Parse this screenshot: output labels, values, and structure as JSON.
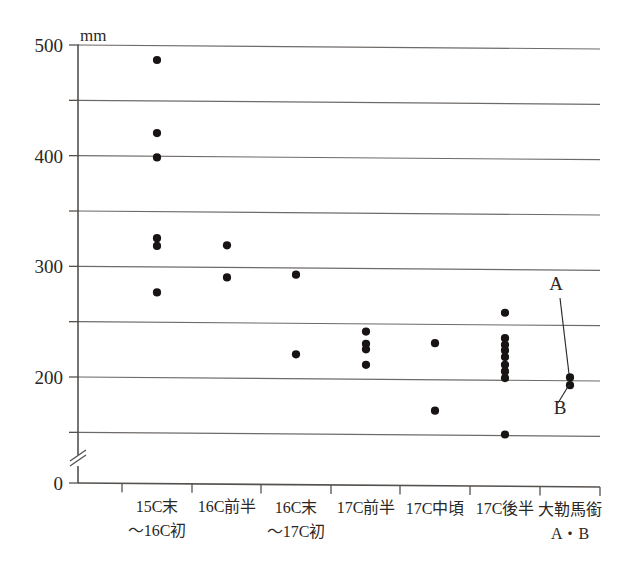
{
  "chart_data": {
    "type": "scatter",
    "title": "",
    "subtitle": "",
    "xlabel": "",
    "ylabel": "",
    "unit_label": "mm",
    "ylim": [
      0,
      500
    ],
    "axis_break": true,
    "axis_break_note": "y-axis broken between 0 and approx 100",
    "grid": true,
    "grid_values": [
      500,
      450,
      400,
      350,
      300,
      250,
      200,
      150
    ],
    "ytick_labels": [
      "500",
      "400",
      "300",
      "200",
      "0"
    ],
    "ytick_values": [
      500,
      400,
      300,
      200,
      0
    ],
    "legend_position": "none",
    "categories": [
      "15C末\n～16C初",
      "16C前半",
      "16C末\n～17C初",
      "17C前半",
      "17C中頃",
      "17C後半",
      "大勒馬銜\nA・B"
    ],
    "category_labels": [
      {
        "line1": "15C末",
        "line2": "～16C初"
      },
      {
        "line1": "16C前半",
        "line2": ""
      },
      {
        "line1": "16C末",
        "line2": "～17C初"
      },
      {
        "line1": "17C前半",
        "line2": ""
      },
      {
        "line1": "17C中頃",
        "line2": ""
      },
      {
        "line1": "17C後半",
        "line2": ""
      },
      {
        "line1": "大勒馬銜",
        "line2": "A・B"
      }
    ],
    "series": [
      {
        "name": "馬銜寸法",
        "points": [
          {
            "category": 0,
            "values": [
              487,
              421,
              399,
              326,
              319,
              277
            ]
          },
          {
            "category": 1,
            "values": [
              320,
              291
            ]
          },
          {
            "category": 2,
            "values": [
              294,
              222
            ]
          },
          {
            "category": 3,
            "values": [
              243,
              232,
              227,
              213
            ]
          },
          {
            "category": 4,
            "values": [
              233,
              172
            ]
          },
          {
            "category": 5,
            "values": [
              261,
              238,
              232,
              227,
              221,
              214,
              208,
              202,
              151
            ]
          },
          {
            "category": 6,
            "values": [
              203,
              196
            ]
          }
        ]
      }
    ],
    "annotations": [
      {
        "label": "A",
        "target_category": 6,
        "target_value": 203
      },
      {
        "label": "B",
        "target_category": 6,
        "target_value": 196
      }
    ],
    "colors": {
      "point": "#171413",
      "grid": "#6e6a67",
      "axis": "#55514e",
      "text": "#2b2724",
      "background": "#ffffff"
    }
  }
}
